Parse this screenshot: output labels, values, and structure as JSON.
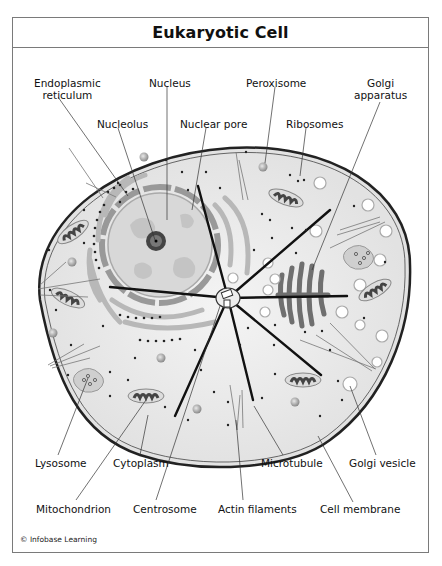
{
  "title": "Eukaryotic Cell",
  "credit": "© Infobase Learning",
  "labels": {
    "endoplasmic_reticulum": {
      "line1": "Endoplasmic",
      "line2": "reticulum"
    },
    "nucleus": "Nucleus",
    "peroxisome": "Peroxisome",
    "golgi_apparatus": {
      "line1": "Golgi",
      "line2": "apparatus"
    },
    "nucleolus": "Nucleolus",
    "nuclear_pore": "Nuclear pore",
    "ribosomes": "Ribosomes",
    "lysosome": "Lysosome",
    "cytoplasm": "Cytoplasm",
    "microtubule": "Microtubule",
    "golgi_vesicle": "Golgi vesicle",
    "mitochondrion": "Mitochondrion",
    "centrosome": "Centrosome",
    "actin_filaments": "Actin filaments",
    "cell_membrane": "Cell membrane"
  },
  "colors": {
    "frame": "#7a7a7a",
    "cytoplasm": "#ececec",
    "membrane": "#333333",
    "nucleus": "#d6d6d6",
    "organelle_dark": "#555555",
    "golgi": "#6f6f6f"
  }
}
